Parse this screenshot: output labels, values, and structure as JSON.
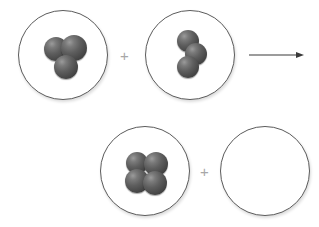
{
  "diagram": {
    "type": "reaction-scheme",
    "background_color": "#ffffff",
    "atom_color": "#4a4a4a",
    "circle_border_color": "#5c5c5c",
    "operator_color": "#a7a7a7",
    "arrow_color": "#3a3a3a"
  },
  "operators": {
    "plus_top_label": "+",
    "plus_bottom_label": "+",
    "arrow_label": "yields-arrow"
  },
  "containers": [
    {
      "id": "reactant-1",
      "role": "reactant",
      "row": "top",
      "position": {
        "x": 18,
        "y": 10,
        "size": 90
      },
      "atom_count": 3,
      "arrangement": "triangular-cluster",
      "atoms": [
        {
          "cx": 37,
          "cy": 38,
          "r": 12
        },
        {
          "cx": 55,
          "cy": 37,
          "r": 13
        },
        {
          "cx": 47,
          "cy": 56,
          "r": 12
        }
      ]
    },
    {
      "id": "reactant-2",
      "role": "reactant",
      "row": "top",
      "position": {
        "x": 145,
        "y": 10,
        "size": 90
      },
      "atom_count": 3,
      "arrangement": "bent-chain",
      "atoms": [
        {
          "cx": 42,
          "cy": 30,
          "r": 11
        },
        {
          "cx": 50,
          "cy": 43,
          "r": 11
        },
        {
          "cx": 42,
          "cy": 56,
          "r": 11
        }
      ]
    },
    {
      "id": "product-1",
      "role": "product",
      "row": "bottom",
      "position": {
        "x": 100,
        "y": 126,
        "size": 90
      },
      "atom_count": 4,
      "arrangement": "square-cluster",
      "atoms": [
        {
          "cx": 36,
          "cy": 36,
          "r": 11
        },
        {
          "cx": 55,
          "cy": 37,
          "r": 12
        },
        {
          "cx": 36,
          "cy": 54,
          "r": 12
        },
        {
          "cx": 54,
          "cy": 56,
          "r": 12
        }
      ]
    },
    {
      "id": "product-2",
      "role": "product",
      "row": "bottom",
      "position": {
        "x": 220,
        "y": 126,
        "size": 90
      },
      "atom_count": 0,
      "arrangement": "empty",
      "atoms": []
    }
  ],
  "plus_signs": [
    {
      "id": "plus-top",
      "x": 120,
      "y": 48
    },
    {
      "id": "plus-bottom",
      "x": 200,
      "y": 164
    }
  ],
  "arrow": {
    "id": "reaction-arrow",
    "x": 249,
    "y": 50,
    "width": 55,
    "height": 9,
    "direction": "right"
  }
}
